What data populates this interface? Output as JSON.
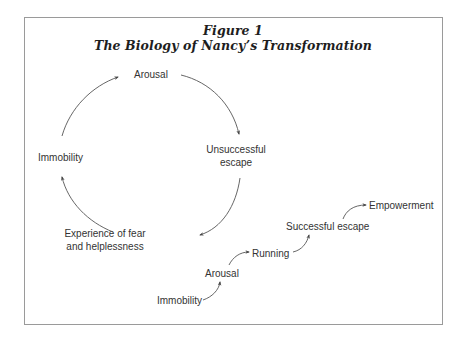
{
  "figure": {
    "number_label": "Figure 1",
    "title": "The Biology of Nancy’s Transformation"
  },
  "cycle": {
    "nodes": [
      {
        "id": "arousal",
        "label": "Arousal"
      },
      {
        "id": "unsuccessful-escape",
        "line1": "Unsuccessful",
        "line2": "escape"
      },
      {
        "id": "experience-fear",
        "line1": "Experience of fear",
        "line2": "and helplessness"
      },
      {
        "id": "immobility",
        "label": "Immobility"
      }
    ],
    "edges": [
      {
        "from": "immobility",
        "to": "arousal"
      },
      {
        "from": "arousal",
        "to": "unsuccessful-escape"
      },
      {
        "from": "unsuccessful-escape",
        "to": "experience-fear"
      },
      {
        "from": "experience-fear",
        "to": "immobility"
      }
    ]
  },
  "progression": {
    "steps": [
      {
        "id": "immobility",
        "label": "Immobility"
      },
      {
        "id": "arousal",
        "label": "Arousal"
      },
      {
        "id": "running",
        "label": "Running"
      },
      {
        "id": "successful-escape",
        "label": "Successful escape"
      },
      {
        "id": "empowerment",
        "label": "Empowerment"
      }
    ],
    "edges": [
      {
        "from": "immobility",
        "to": "arousal"
      },
      {
        "from": "arousal",
        "to": "running"
      },
      {
        "from": "running",
        "to": "successful-escape"
      },
      {
        "from": "successful-escape",
        "to": "empowerment"
      }
    ]
  },
  "colors": {
    "border": "#9a9a9a",
    "line": "#555555",
    "text": "#333333",
    "title": "#1e1e1e"
  }
}
